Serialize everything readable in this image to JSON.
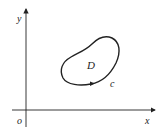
{
  "diagram": {
    "axes": {
      "x_label": "x",
      "y_label": "y",
      "origin_label": "o"
    },
    "region_label": "D",
    "curve_label": "c",
    "curve_orientation": "counterclockwise",
    "colors": {
      "stroke": "#222222",
      "background": "#ffffff"
    }
  }
}
